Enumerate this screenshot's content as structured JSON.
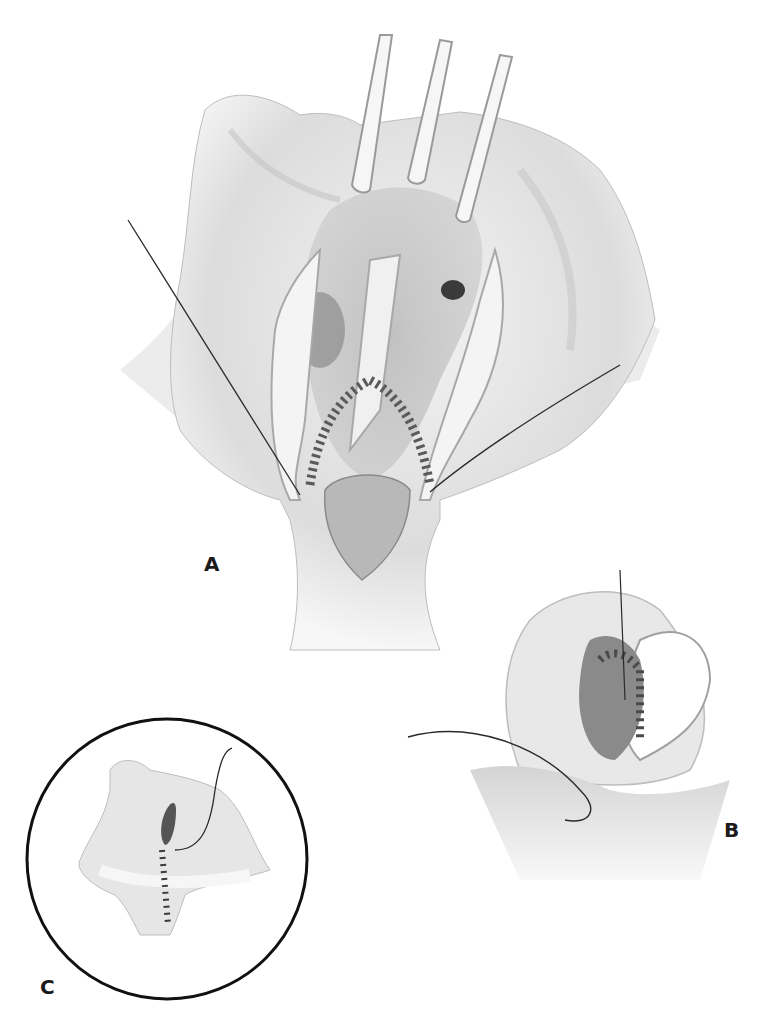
{
  "figure": {
    "type": "surgical-illustration",
    "style": "grayscale pencil rendering",
    "colors": {
      "background": "#ffffff",
      "tissue_light": "#eeeeee",
      "tissue_mid": "#cfcfcf",
      "tissue_dark": "#8a8a8a",
      "cavity": "#707070",
      "suture": "#2a2a2a",
      "circle_outline": "#111111",
      "label": "#1a1a1a"
    },
    "panels": [
      {
        "id": "A",
        "label": "A",
        "description": "Opened structure held by three retractors with a running suture line along the inner margin"
      },
      {
        "id": "B",
        "label": "B",
        "description": "Close-up of suturing with a curved needle and thread"
      },
      {
        "id": "C",
        "label": "C",
        "description": "Circular inset showing completed closure with interrupted stitches"
      }
    ]
  }
}
